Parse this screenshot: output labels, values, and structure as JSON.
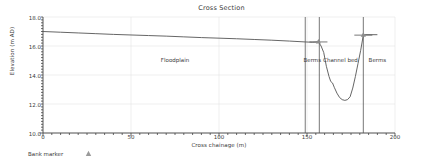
{
  "chart_data": {
    "type": "line",
    "title": "Cross Section",
    "xlabel": "Cross chainage (m)",
    "ylabel": "Elevation (m AD)",
    "xlim": [
      0,
      200
    ],
    "ylim": [
      10.0,
      18.0
    ],
    "xticks": [
      0,
      50,
      100,
      150,
      200
    ],
    "xtick_labels": [
      "0",
      "50",
      "100",
      "150",
      "200"
    ],
    "yticks": [
      10.0,
      12.0,
      14.0,
      16.0,
      18.0
    ],
    "ytick_labels": [
      "10.0",
      "12.0",
      "14.0",
      "16.0",
      "18.0"
    ],
    "grid": true,
    "legend_position": "below-left",
    "series": [
      {
        "name": "Cross section profile",
        "color": "#555555",
        "x": [
          0,
          10,
          20,
          30,
          40,
          50,
          60,
          70,
          80,
          90,
          100,
          110,
          120,
          130,
          140,
          149,
          153,
          156.5,
          158,
          159.5,
          161,
          162.5,
          163.5,
          164.5,
          165.5,
          167,
          168.5,
          170,
          171.5,
          173,
          174.5,
          176,
          177.5,
          179,
          180.5,
          182,
          183.5,
          190
        ],
        "y": [
          17.0,
          16.95,
          16.9,
          16.85,
          16.8,
          16.76,
          16.72,
          16.68,
          16.63,
          16.58,
          16.54,
          16.5,
          16.45,
          16.4,
          16.34,
          16.28,
          16.26,
          16.28,
          16.0,
          15.55,
          14.6,
          13.9,
          13.55,
          13.45,
          13.15,
          12.75,
          12.45,
          12.3,
          12.25,
          12.3,
          12.5,
          13.1,
          13.9,
          14.8,
          15.7,
          16.75,
          16.78,
          16.78
        ]
      }
    ],
    "bank_markers": [
      {
        "x": 156.5,
        "y": 16.28,
        "label": "left-bank-marker"
      },
      {
        "x": 182,
        "y": 16.75,
        "label": "right-bank-marker"
      }
    ],
    "vlines": [
      {
        "x": 149,
        "label": "berms-left-outer"
      },
      {
        "x": 157,
        "label": "berms-left-inner"
      },
      {
        "x": 182,
        "label": "berms-right"
      }
    ],
    "annotations": [
      {
        "text": "Floodplain",
        "x": 75,
        "y": 14.95
      },
      {
        "text": "Berms",
        "x": 153,
        "y": 14.95
      },
      {
        "text": "Channel bed",
        "x": 169,
        "y": 14.95
      },
      {
        "text": "Berms",
        "x": 190,
        "y": 14.95
      }
    ]
  },
  "legend": {
    "label": "Bank marker",
    "marker_name": "triangle-marker",
    "marker_color": "#9a9a9a"
  },
  "colors": {
    "line": "#555555",
    "axis": "#444444",
    "grid": "#e4e4e4",
    "text": "#3a3a3a",
    "vline": "#555555",
    "background": "#ffffff"
  }
}
